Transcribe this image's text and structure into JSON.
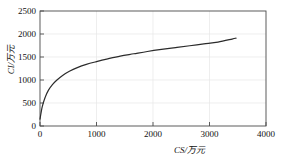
{
  "chart_data": {
    "type": "line",
    "title": "",
    "subtitle": "",
    "xlabel": "CS/万元",
    "ylabel": "CI/万元",
    "xlim": [
      0,
      4000
    ],
    "ylim": [
      0,
      2500
    ],
    "xticks": [
      0,
      1000,
      2000,
      3000,
      4000
    ],
    "yticks": [
      0,
      500,
      1000,
      1500,
      2000,
      2500
    ],
    "xtick_labels": [
      "0",
      "1000",
      "2000",
      "3000",
      "4000"
    ],
    "ytick_labels": [
      "0",
      "500",
      "1000",
      "1500",
      "2000",
      "2500"
    ],
    "grid": true,
    "grid_color": "#e3e3e3",
    "legend": null,
    "line_color": "#2b2b2b",
    "line_width": 1.2,
    "series": [
      {
        "name": "CI vs CS",
        "x": [
          0,
          40,
          90,
          150,
          220,
          300,
          400,
          520,
          660,
          820,
          1000,
          1200,
          1420,
          1660,
          1900,
          2150,
          2400,
          2650,
          2900,
          3150,
          3400,
          3470
        ],
        "y": [
          150,
          420,
          620,
          780,
          900,
          1000,
          1100,
          1190,
          1270,
          1340,
          1400,
          1460,
          1520,
          1570,
          1620,
          1665,
          1705,
          1745,
          1785,
          1825,
          1890,
          1910
        ]
      }
    ],
    "annotations": []
  },
  "figure": {
    "background": "#ffffff",
    "axes_color": "#4a4a4a",
    "width": 286,
    "height": 160
  }
}
